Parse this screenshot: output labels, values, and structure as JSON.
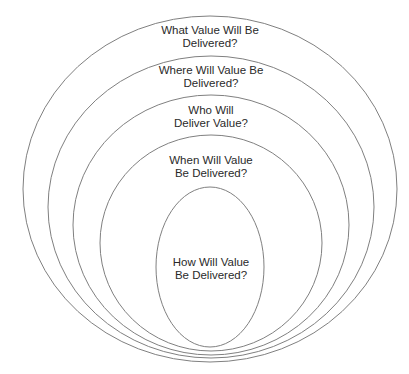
{
  "diagram": {
    "type": "nested-ellipses",
    "stroke_color": "#808080",
    "text_color": "#2a2a2a",
    "layers": [
      {
        "id": "what",
        "label": "What Value Will Be\nDelivered?",
        "cx": 210,
        "cy": 189,
        "rx": 187,
        "ry": 173,
        "label_x": 210,
        "label_y": 24
      },
      {
        "id": "where",
        "label": "Where Will Value Be\nDelivered?",
        "cx": 211,
        "cy": 207,
        "rx": 163,
        "ry": 151,
        "label_x": 211,
        "label_y": 64
      },
      {
        "id": "who",
        "label": "Who Will\nDeliver Value?",
        "cx": 211,
        "cy": 225,
        "rx": 138,
        "ry": 130,
        "label_x": 211,
        "label_y": 104
      },
      {
        "id": "when",
        "label": "When Will Value\nBe Delivered?",
        "cx": 211,
        "cy": 243,
        "rx": 111,
        "ry": 108,
        "label_x": 211,
        "label_y": 154
      },
      {
        "id": "how",
        "label": "How Will Value\nBe Delivered?",
        "cx": 210,
        "cy": 267,
        "rx": 54,
        "ry": 80,
        "label_x": 211,
        "label_y": 256
      }
    ]
  }
}
